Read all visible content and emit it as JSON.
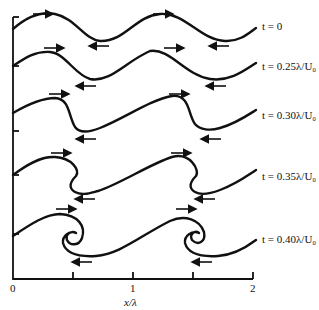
{
  "figure": {
    "x_axis": {
      "label": "x/λ",
      "ticks": [
        "0",
        "1",
        "2"
      ],
      "minor_ticks_at": [
        0.5,
        1.5
      ]
    },
    "panels": [
      {
        "label": "t = 0"
      },
      {
        "label": "t = 0.25λ/U₀"
      },
      {
        "label": "t = 0.30λ/U₀"
      },
      {
        "label": "t = 0.35λ/U₀"
      },
      {
        "label": "t = 0.40λ/U₀"
      }
    ],
    "arrows": {
      "upper_direction": "right",
      "lower_direction": "left"
    },
    "colors": {
      "line": "#111111",
      "background": "#ffffff"
    }
  }
}
